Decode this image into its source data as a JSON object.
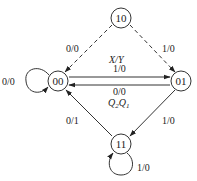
{
  "diagram": {
    "type": "state-transition-diagram",
    "legend": {
      "edge_label_format": "X/Y",
      "state_label_format_prefix": "Q",
      "state_label_format_sub2": "2",
      "state_label_format_mid": "Q",
      "state_label_format_sub1": "1"
    },
    "states": [
      {
        "id": "s10",
        "label": "10"
      },
      {
        "id": "s00",
        "label": "00"
      },
      {
        "id": "s01",
        "label": "01"
      },
      {
        "id": "s11",
        "label": "11"
      }
    ],
    "transitions": [
      {
        "from": "10",
        "to": "00",
        "label": "0/0",
        "style": "dashed"
      },
      {
        "from": "10",
        "to": "01",
        "label": "1/0",
        "style": "dashed"
      },
      {
        "from": "00",
        "to": "01",
        "label": "1/0",
        "style": "solid"
      },
      {
        "from": "01",
        "to": "00",
        "label": "0/0",
        "style": "solid"
      },
      {
        "from": "01",
        "to": "11",
        "label": "1/0",
        "style": "solid"
      },
      {
        "from": "11",
        "to": "00",
        "label": "0/1",
        "style": "solid"
      },
      {
        "from": "00",
        "to": "00",
        "label": "0/0",
        "style": "self-loop"
      },
      {
        "from": "11",
        "to": "11",
        "label": "1/0",
        "style": "self-loop"
      }
    ]
  }
}
